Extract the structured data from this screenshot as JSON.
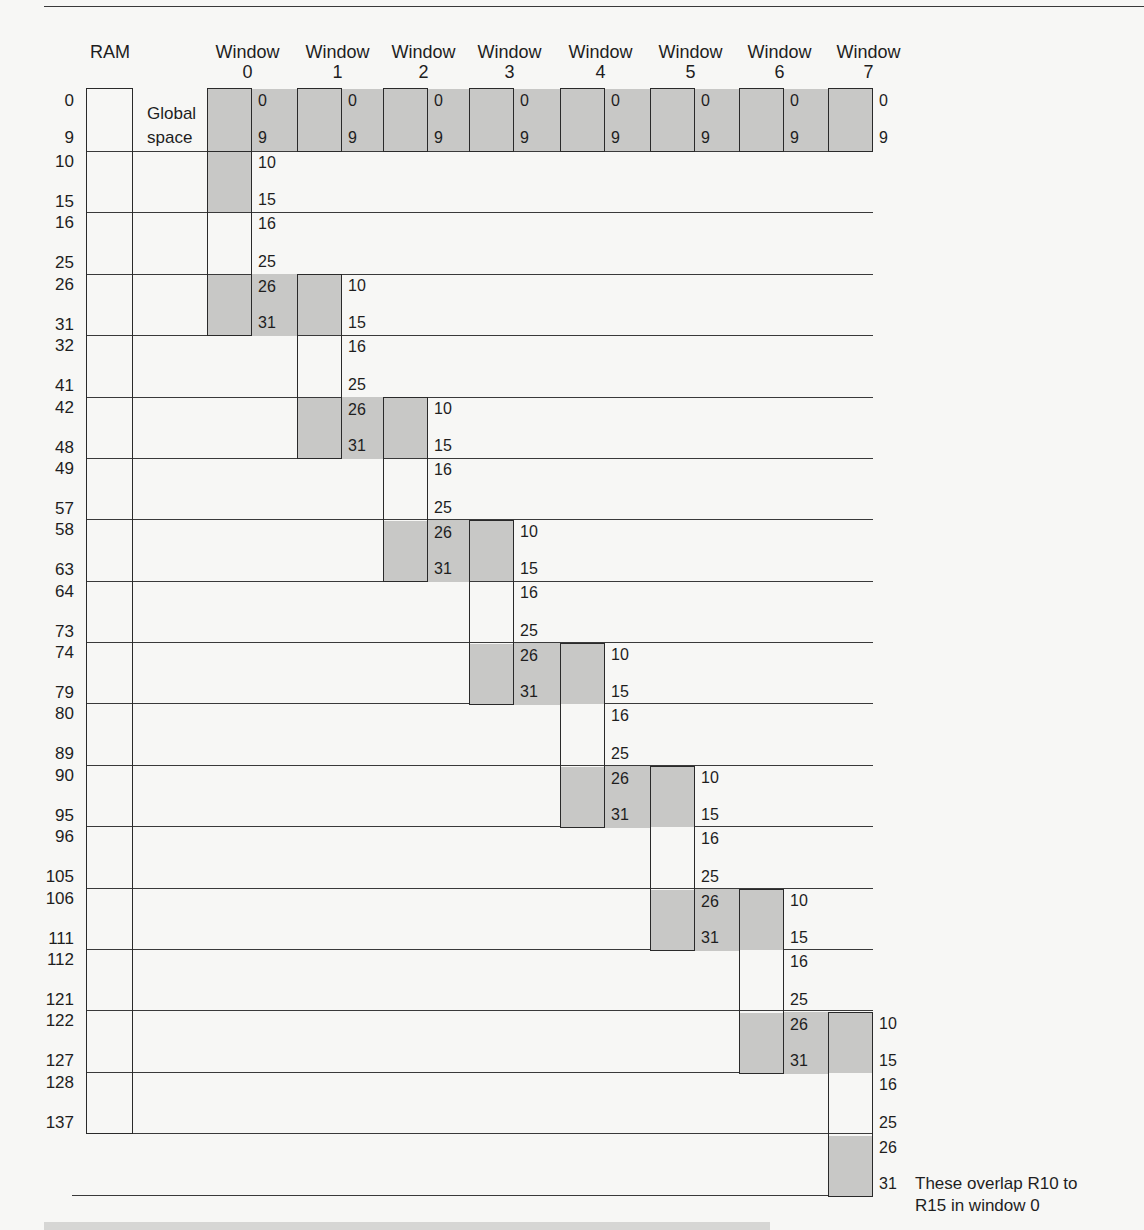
{
  "diagram": {
    "ram_label": "RAM",
    "global_label_line1": "Global",
    "global_label_line2": "space",
    "window_word": "Window",
    "windows": [
      "0",
      "1",
      "2",
      "3",
      "4",
      "5",
      "6",
      "7"
    ],
    "ram_addresses": [
      "0",
      "9",
      "10",
      "15",
      "16",
      "25",
      "26",
      "31",
      "32",
      "41",
      "42",
      "48",
      "49",
      "57",
      "58",
      "63",
      "64",
      "73",
      "74",
      "79",
      "80",
      "89",
      "90",
      "95",
      "96",
      "105",
      "106",
      "111",
      "112",
      "121",
      "122",
      "127",
      "128",
      "137"
    ],
    "register_labels": {
      "global": [
        "0",
        "9"
      ],
      "window": [
        "10",
        "15",
        "16",
        "25",
        "26",
        "31"
      ]
    },
    "note_line1": "These overlap R10 to",
    "note_line2": "R15 in window 0",
    "colors": {
      "background": "#f7f7f5",
      "shaded": "#c8c8c6",
      "line": "#3a3a3a",
      "text": "#1e1e1e"
    }
  }
}
